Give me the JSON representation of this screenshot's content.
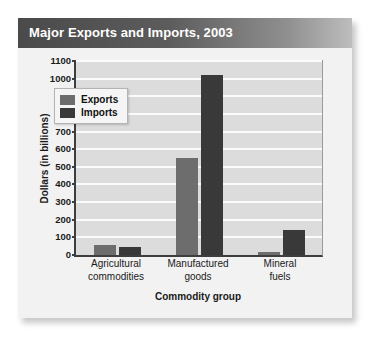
{
  "card": {
    "title": "Major Exports and Imports, 2003"
  },
  "chart_data": {
    "type": "bar",
    "title": "Major Exports and Imports, 2003",
    "xlabel": "Commodity group",
    "ylabel": "Dollars (in billions)",
    "categories": [
      "Agricultural commodities",
      "Manufactured goods",
      "Mineral fuels"
    ],
    "category_lines": [
      [
        "Agricultural",
        "commodities"
      ],
      [
        "Manufactured",
        "goods"
      ],
      [
        "Mineral",
        "fuels"
      ]
    ],
    "series": [
      {
        "name": "Exports",
        "color": "#6d6d6d",
        "values": [
          55,
          550,
          15
        ]
      },
      {
        "name": "Imports",
        "color": "#393939",
        "values": [
          45,
          1020,
          140
        ]
      }
    ],
    "ylim": [
      0,
      1100
    ],
    "ytick_step": 100,
    "yticks": [
      0,
      100,
      200,
      300,
      400,
      500,
      600,
      700,
      800,
      900,
      1000,
      1100
    ],
    "ytick_labels": [
      "0",
      "100",
      "200",
      "300",
      "400",
      "500",
      "600",
      "700",
      "800",
      "900",
      "1000",
      "1100"
    ],
    "grid": true,
    "grid_axis": "y",
    "legend_position": "upper-left-inside",
    "plot_background": "#dcdcdc",
    "gridline_color": "#fbfbfb",
    "axis_color": "#3d3d3d"
  }
}
